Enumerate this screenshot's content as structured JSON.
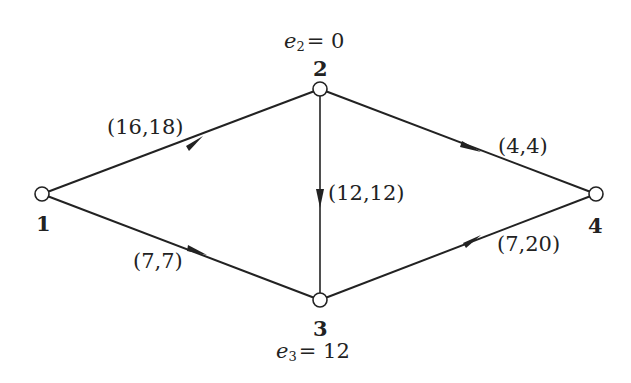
{
  "diagram": {
    "type": "flow-network",
    "nodes": [
      {
        "id": "1",
        "label": "1",
        "x": 42,
        "y": 194,
        "excess": null
      },
      {
        "id": "2",
        "label": "2",
        "x": 320,
        "y": 89,
        "excess": {
          "var": "e",
          "sub": "2",
          "eq": "= 0"
        }
      },
      {
        "id": "3",
        "label": "3",
        "x": 320,
        "y": 300,
        "excess": {
          "var": "e",
          "sub": "3",
          "eq": "= 12"
        }
      },
      {
        "id": "4",
        "label": "4",
        "x": 596,
        "y": 194,
        "excess": null
      }
    ],
    "edges": [
      {
        "from": "1",
        "to": "2",
        "label": "(16,18)"
      },
      {
        "from": "1",
        "to": "3",
        "label": "(7,7)"
      },
      {
        "from": "2",
        "to": "3",
        "label": "(12,12)"
      },
      {
        "from": "2",
        "to": "4",
        "label": "(4,4)"
      },
      {
        "from": "3",
        "to": "4",
        "label": "(7,20)"
      }
    ],
    "colors": {
      "stroke": "#222222",
      "node_fill": "#ffffff"
    }
  }
}
